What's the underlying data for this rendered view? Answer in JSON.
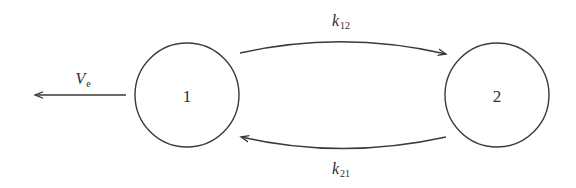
{
  "diagram": {
    "type": "two-compartment model",
    "nodes": [
      {
        "id": "1",
        "label": "1",
        "cx": 187,
        "cy": 95,
        "r": 52
      },
      {
        "id": "2",
        "label": "2",
        "cx": 497,
        "cy": 95,
        "r": 52
      }
    ],
    "edges": [
      {
        "id": "k12",
        "from": "1",
        "to": "2",
        "label_main": "k",
        "label_sub": "12",
        "label_x": 341,
        "label_y": 22
      },
      {
        "id": "k21",
        "from": "2",
        "to": "1",
        "label_main": "k",
        "label_sub": "21",
        "label_x": 341,
        "label_y": 170
      },
      {
        "id": "ve",
        "from": "1",
        "to": "outside",
        "label_main": "V",
        "label_sub": "e",
        "label_x": 82,
        "label_y": 80
      }
    ],
    "colors": {
      "stroke": "#3a3a3a",
      "text": "#2e2e2e",
      "background": "#ffffff"
    }
  }
}
